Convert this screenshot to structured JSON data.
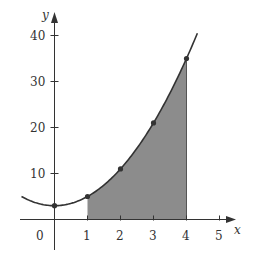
{
  "chart_data": {
    "type": "line",
    "title": "",
    "xlabel": "x",
    "ylabel": "y",
    "xlim": [
      -1.0,
      5.5
    ],
    "ylim": [
      -5,
      43
    ],
    "x_ticks": [
      0,
      1,
      2,
      3,
      4,
      5
    ],
    "x_tick_labels": [
      "0",
      "1",
      "2",
      "3",
      "4",
      "5"
    ],
    "y_ticks": [
      10,
      20,
      30,
      40
    ],
    "y_tick_labels": [
      "10",
      "20",
      "30",
      "40"
    ],
    "grid": false,
    "legend": null,
    "curve": {
      "function": "y = 2x^2 + 3",
      "x_range": [
        -1.0,
        4.33
      ],
      "color": "#333333"
    },
    "points": [
      {
        "x": 0,
        "y": 3
      },
      {
        "x": 1,
        "y": 5
      },
      {
        "x": 2,
        "y": 11
      },
      {
        "x": 3,
        "y": 21
      },
      {
        "x": 4,
        "y": 35
      }
    ],
    "shaded_region": {
      "x_from": 1,
      "x_to": 4,
      "description": "area under curve between x=1 and x=4",
      "color": "#8c8c8c"
    }
  },
  "labels": {
    "x_axis": "x",
    "y_axis": "y",
    "origin": "0",
    "x1": "1",
    "x2": "2",
    "x3": "3",
    "x4": "4",
    "x5": "5",
    "y10": "10",
    "y20": "20",
    "y30": "30",
    "y40": "40"
  }
}
